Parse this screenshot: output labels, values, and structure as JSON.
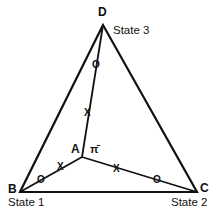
{
  "diagram": {
    "type": "ternary-triangle",
    "colors": {
      "line": "#111111",
      "background": "#ffffff"
    },
    "vertices": {
      "D": {
        "label": "D",
        "state_label": "State 3"
      },
      "B": {
        "label": "B",
        "state_label": "State 1"
      },
      "C": {
        "label": "C",
        "state_label": "State 2"
      }
    },
    "interior_point": {
      "label": "A",
      "symbol": "π̄"
    },
    "edges": [
      "B-C",
      "C-D",
      "D-B"
    ],
    "spokes": [
      {
        "from": "A",
        "to": "D",
        "marks": [
          "X",
          "O"
        ]
      },
      {
        "from": "A",
        "to": "B",
        "marks": [
          "X",
          "O"
        ]
      },
      {
        "from": "A",
        "to": "C",
        "marks": [
          "X",
          "O"
        ]
      }
    ],
    "mark_labels": {
      "x": "X",
      "o": "O"
    }
  }
}
